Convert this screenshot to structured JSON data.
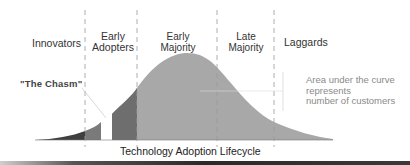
{
  "diagram": {
    "title": "Technology Adoption Lifecycle",
    "segments": [
      {
        "label": "Innovators",
        "fill": "#4a4a4a"
      },
      {
        "label": "Early\nAdopters",
        "fill": "#6e6e6e"
      },
      {
        "label": "Early\nMajority",
        "fill": "#a6a6a6"
      },
      {
        "label": "Late\nMajority",
        "fill": "#a6a6a6"
      },
      {
        "label": "Laggards",
        "fill": "#a6a6a6"
      }
    ],
    "labels": {
      "innovators": "Innovators",
      "early_adopters_1": "Early",
      "early_adopters_2": "Adopters",
      "early_majority_1": "Early",
      "early_majority_2": "Majority",
      "late_majority_1": "Late",
      "late_majority_2": "Majority",
      "laggards": "Laggards"
    },
    "chasm_label": "\"The Chasm\"",
    "annotation": {
      "line1": "Area under the curve",
      "line2": "represents",
      "line3": "number of customers"
    },
    "caption": "Technology Adoption Lifecycle",
    "colors": {
      "curve_main": "#a6a6a6",
      "early_adopters": "#6e6e6e",
      "innovators": "#3f3f3f",
      "divider": "#9a9a9a"
    }
  }
}
